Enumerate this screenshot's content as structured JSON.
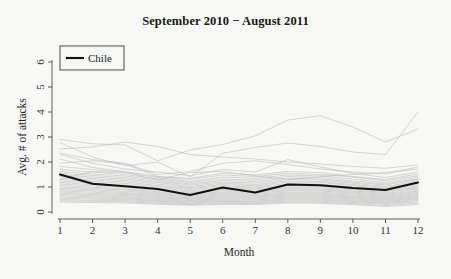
{
  "figure": {
    "background_color": "#f7f7f5",
    "width": 451,
    "height": 279
  },
  "title": "September 2010 − August 2011",
  "axes": {
    "x_title": "Month",
    "y_title": "Avg. # of attacks",
    "x_tick_labels": [
      "1",
      "2",
      "3",
      "4",
      "5",
      "6",
      "7",
      "8",
      "9",
      "10",
      "11",
      "12"
    ],
    "y_tick_labels": [
      "0",
      "1",
      "2",
      "3",
      "4",
      "5",
      "6"
    ]
  },
  "legend": {
    "entries": [
      {
        "label": "Chile",
        "color": "#101010",
        "style": "solid-bold"
      }
    ]
  },
  "chart_data": {
    "type": "line",
    "title": "September 2010 − August 2011",
    "xlabel": "Month",
    "ylabel": "Avg. # of attacks",
    "xlim": [
      1,
      12
    ],
    "ylim": [
      0,
      6.3
    ],
    "grid": false,
    "legend_position": "top-left",
    "x": [
      1,
      2,
      3,
      4,
      5,
      6,
      7,
      8,
      9,
      10,
      11,
      12
    ],
    "highlight_color": "#101010",
    "background_series_color": "#b9b9b9",
    "series": [
      {
        "name": "Chile",
        "highlight": true,
        "values": [
          1.5,
          1.13,
          1.03,
          0.92,
          0.68,
          0.98,
          0.78,
          1.1,
          1.07,
          0.96,
          0.88,
          1.18
        ]
      },
      {
        "name": "country-01",
        "values": [
          2.9,
          2.73,
          2.68,
          2.05,
          2.48,
          2.7,
          3.05,
          3.68,
          3.85,
          3.4,
          2.8,
          3.32
        ]
      },
      {
        "name": "country-02",
        "values": [
          2.78,
          2.2,
          1.85,
          2.0,
          1.4,
          2.35,
          2.58,
          2.76,
          2.62,
          2.4,
          2.3,
          4.0
        ]
      },
      {
        "name": "country-03",
        "values": [
          2.52,
          2.6,
          2.8,
          2.62,
          2.3,
          2.2,
          2.12,
          2.0,
          1.92,
          1.82,
          1.75,
          1.88
        ]
      },
      {
        "name": "country-04",
        "values": [
          2.3,
          1.95,
          1.72,
          1.6,
          1.45,
          1.7,
          1.6,
          2.1,
          1.8,
          1.55,
          1.38,
          1.6
        ]
      },
      {
        "name": "country-05",
        "values": [
          2.12,
          1.78,
          1.62,
          1.42,
          1.35,
          1.55,
          1.48,
          1.62,
          1.58,
          1.42,
          1.3,
          1.52
        ]
      },
      {
        "name": "country-06",
        "values": [
          1.95,
          2.05,
          1.92,
          1.42,
          1.3,
          1.48,
          1.42,
          1.55,
          1.5,
          1.4,
          1.25,
          1.45
        ]
      },
      {
        "name": "country-07",
        "values": [
          1.82,
          1.7,
          1.58,
          1.38,
          1.22,
          1.4,
          1.35,
          1.48,
          1.45,
          1.32,
          1.18,
          1.38
        ]
      },
      {
        "name": "country-08",
        "values": [
          1.7,
          1.6,
          1.5,
          1.32,
          1.18,
          1.32,
          1.28,
          1.42,
          1.38,
          1.25,
          1.12,
          1.32
        ]
      },
      {
        "name": "country-09",
        "values": [
          1.62,
          1.52,
          1.44,
          1.28,
          1.12,
          1.26,
          1.22,
          1.36,
          1.32,
          1.2,
          1.08,
          1.3
        ]
      },
      {
        "name": "country-10",
        "values": [
          1.55,
          1.46,
          1.38,
          1.22,
          1.08,
          1.2,
          1.16,
          1.3,
          1.28,
          1.15,
          1.02,
          1.24
        ]
      },
      {
        "name": "country-11",
        "values": [
          1.48,
          1.4,
          1.32,
          1.18,
          1.02,
          1.15,
          1.1,
          1.24,
          1.22,
          1.1,
          0.98,
          1.2
        ]
      },
      {
        "name": "country-12",
        "values": [
          1.42,
          1.34,
          1.26,
          1.12,
          0.98,
          1.1,
          1.05,
          1.2,
          1.18,
          1.06,
          0.94,
          1.16
        ]
      },
      {
        "name": "country-13",
        "values": [
          1.36,
          1.28,
          1.2,
          1.06,
          0.94,
          1.05,
          1.0,
          1.14,
          1.12,
          1.0,
          0.9,
          1.1
        ]
      },
      {
        "name": "country-14",
        "values": [
          1.3,
          1.22,
          1.14,
          1.02,
          0.9,
          1.0,
          0.96,
          1.08,
          1.06,
          0.96,
          0.86,
          1.05
        ]
      },
      {
        "name": "country-15",
        "values": [
          1.24,
          1.16,
          1.08,
          0.96,
          0.85,
          0.95,
          0.92,
          1.04,
          1.02,
          0.92,
          0.82,
          1.0
        ]
      },
      {
        "name": "country-16",
        "values": [
          1.18,
          1.1,
          1.03,
          0.92,
          0.8,
          0.9,
          0.88,
          0.98,
          0.97,
          0.88,
          0.78,
          0.96
        ]
      },
      {
        "name": "country-17",
        "values": [
          1.12,
          1.05,
          0.98,
          0.87,
          0.76,
          0.86,
          0.83,
          0.94,
          0.92,
          0.84,
          0.74,
          0.92
        ]
      },
      {
        "name": "country-18",
        "values": [
          1.06,
          0.99,
          0.92,
          0.82,
          0.72,
          0.81,
          0.79,
          0.89,
          0.88,
          0.8,
          0.7,
          0.87
        ]
      },
      {
        "name": "country-19",
        "values": [
          1.0,
          0.94,
          0.88,
          0.78,
          0.68,
          0.77,
          0.75,
          0.85,
          0.84,
          0.76,
          0.66,
          0.83
        ]
      },
      {
        "name": "country-20",
        "values": [
          0.95,
          0.89,
          0.83,
          0.74,
          0.64,
          0.73,
          0.71,
          0.8,
          0.79,
          0.72,
          0.62,
          0.79
        ]
      },
      {
        "name": "country-21",
        "values": [
          0.9,
          0.84,
          0.78,
          0.7,
          0.6,
          0.69,
          0.67,
          0.76,
          0.75,
          0.68,
          0.58,
          0.74
        ]
      },
      {
        "name": "country-22",
        "values": [
          0.85,
          0.79,
          0.74,
          0.66,
          0.56,
          0.65,
          0.63,
          0.72,
          0.71,
          0.64,
          0.55,
          0.7
        ]
      },
      {
        "name": "country-23",
        "values": [
          0.8,
          0.74,
          0.7,
          0.62,
          0.53,
          0.61,
          0.6,
          0.68,
          0.67,
          0.6,
          0.51,
          0.66
        ]
      },
      {
        "name": "country-24",
        "values": [
          0.75,
          0.7,
          0.66,
          0.58,
          0.5,
          0.57,
          0.56,
          0.64,
          0.63,
          0.57,
          0.48,
          0.62
        ]
      },
      {
        "name": "country-25",
        "values": [
          0.7,
          0.65,
          0.61,
          0.54,
          0.46,
          0.53,
          0.52,
          0.6,
          0.59,
          0.53,
          0.44,
          0.58
        ]
      },
      {
        "name": "country-26",
        "values": [
          0.65,
          0.61,
          0.57,
          0.5,
          0.43,
          0.49,
          0.48,
          0.56,
          0.55,
          0.49,
          0.41,
          0.54
        ]
      },
      {
        "name": "country-27",
        "values": [
          0.6,
          0.56,
          0.53,
          0.46,
          0.4,
          0.45,
          0.44,
          0.52,
          0.51,
          0.45,
          0.37,
          0.5
        ]
      },
      {
        "name": "country-28",
        "values": [
          0.55,
          0.52,
          0.49,
          0.43,
          0.36,
          0.42,
          0.41,
          0.48,
          0.47,
          0.42,
          0.34,
          0.46
        ]
      },
      {
        "name": "country-29",
        "values": [
          0.5,
          0.47,
          0.45,
          0.39,
          0.33,
          0.38,
          0.37,
          0.44,
          0.43,
          0.38,
          0.3,
          0.41
        ]
      },
      {
        "name": "country-30",
        "values": [
          0.45,
          0.43,
          0.41,
          0.35,
          0.3,
          0.34,
          0.34,
          0.4,
          0.39,
          0.34,
          0.26,
          0.36
        ]
      },
      {
        "name": "country-31",
        "values": [
          0.4,
          0.38,
          0.36,
          0.31,
          0.27,
          0.3,
          0.3,
          0.36,
          0.35,
          0.3,
          0.22,
          0.3
        ]
      },
      {
        "name": "country-32",
        "values": [
          2.35,
          2.1,
          1.95,
          1.5,
          1.62,
          1.95,
          2.05,
          1.9,
          1.72,
          1.6,
          1.52,
          1.8
        ]
      },
      {
        "name": "country-33",
        "values": [
          1.3,
          1.62,
          1.58,
          1.3,
          1.58,
          1.62,
          1.45,
          1.3,
          1.42,
          1.5,
          1.58,
          1.72
        ]
      }
    ]
  }
}
